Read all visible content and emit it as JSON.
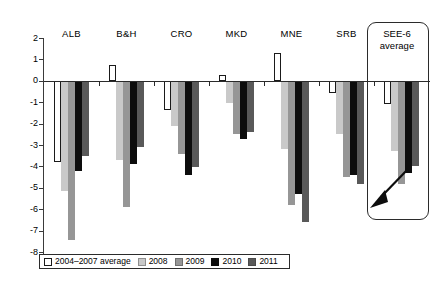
{
  "chart_data": {
    "type": "bar",
    "title": "",
    "subtitle": "",
    "xlabel": "",
    "ylabel": "",
    "ylim": [
      -8,
      2
    ],
    "ytick_labels": [
      "2",
      "1",
      "0",
      "-1",
      "-2",
      "-3",
      "-4",
      "-5",
      "-6",
      "-7",
      "-8"
    ],
    "ytick_values": [
      2,
      1,
      0,
      -1,
      -2,
      -3,
      -4,
      -5,
      -6,
      -7,
      -8
    ],
    "grid": false,
    "legend_position": "bottom",
    "categories": [
      "ALB",
      "B&H",
      "CRO",
      "MKD",
      "MNE",
      "SRB",
      "SEE-6"
    ],
    "series": [
      {
        "name": "2004–2007 average",
        "color": "#ffffff",
        "values": [
          -3.8,
          0.75,
          -1.35,
          0.25,
          1.3,
          -0.55,
          -1.1
        ]
      },
      {
        "name": "2008",
        "color": "#c9c9c9",
        "values": [
          -5.15,
          -3.7,
          -2.1,
          -1.05,
          -3.2,
          -2.5,
          -3.3
        ]
      },
      {
        "name": "2009",
        "color": "#969696",
        "values": [
          -7.45,
          -5.9,
          -3.4,
          -2.5,
          -5.8,
          -4.5,
          -4.8
        ]
      },
      {
        "name": "2010",
        "color": "#0d0d0d",
        "values": [
          -4.2,
          -3.9,
          -4.4,
          -2.7,
          -5.3,
          -4.4,
          -4.3
        ]
      },
      {
        "name": "2011",
        "color": "#595959",
        "values": [
          -3.5,
          -3.1,
          -4.05,
          -2.4,
          -6.6,
          -4.8,
          -4.0
        ]
      }
    ]
  },
  "annotations": {
    "see6_box_label": "SEE-6\naverage",
    "see6_box_label_line1": "SEE-6",
    "see6_box_label_line2": "average",
    "arrow_name": "down-left-arrow"
  },
  "legend": {
    "items": [
      {
        "label": "2004–2007 average",
        "swatch": "s0"
      },
      {
        "label": "2008",
        "swatch": "s1"
      },
      {
        "label": "2009",
        "swatch": "s2"
      },
      {
        "label": "2010",
        "swatch": "s3"
      },
      {
        "label": "2011",
        "swatch": "s4"
      }
    ]
  }
}
